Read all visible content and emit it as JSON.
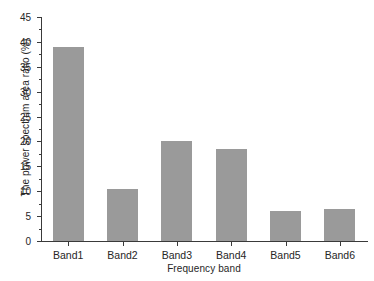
{
  "chart_data": {
    "type": "bar",
    "title": "",
    "xlabel": "Frequency band",
    "ylabel": "The power spectrum area ratio (%)",
    "categories": [
      "Band1",
      "Band2",
      "Band3",
      "Band4",
      "Band5",
      "Band6"
    ],
    "values": [
      39.0,
      10.4,
      20.1,
      18.5,
      6.0,
      6.4
    ],
    "ylim": [
      0,
      45
    ],
    "ytick_labels": [
      "0",
      "5",
      "10",
      "15",
      "20",
      "25",
      "30",
      "35",
      "40",
      "45"
    ],
    "ytick_values": [
      0,
      5,
      10,
      15,
      20,
      25,
      30,
      35,
      40,
      45
    ],
    "yminor_values": [
      2.5,
      7.5,
      12.5,
      17.5,
      22.5,
      27.5,
      32.5,
      37.5,
      42.5
    ],
    "grid": false,
    "legend": false,
    "legend_position": "none",
    "bar_color": "#9a9a9a",
    "axis_color": "#3a3a3a",
    "text_color": "#262626",
    "background": "#ffffff"
  }
}
